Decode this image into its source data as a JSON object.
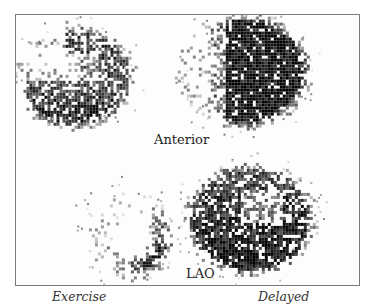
{
  "figure": {
    "labels": {
      "anterior": "Anterior",
      "lao": "LAO"
    },
    "captions": {
      "exercise": "Exercise",
      "delayed": "Delayed"
    },
    "colors": {
      "frame_border": "#7a7a7a",
      "ink": "#111111",
      "background": "#fdfdfd"
    },
    "panels": [
      {
        "name": "anterior-exercise",
        "cx": 57,
        "cy": 60,
        "rx": 50,
        "ry": 44,
        "shape": "defect-top",
        "density": 0.85
      },
      {
        "name": "anterior-delayed",
        "cx": 227,
        "cy": 55,
        "rx": 55,
        "ry": 48,
        "shape": "full-scatter-left",
        "density": 0.9
      },
      {
        "name": "lao-exercise",
        "cx": 113,
        "cy": 220,
        "rx": 43,
        "ry": 42,
        "shape": "crescent",
        "density": 0.8
      },
      {
        "name": "lao-delayed",
        "cx": 233,
        "cy": 203,
        "rx": 55,
        "ry": 47,
        "shape": "full",
        "density": 0.88
      }
    ]
  }
}
